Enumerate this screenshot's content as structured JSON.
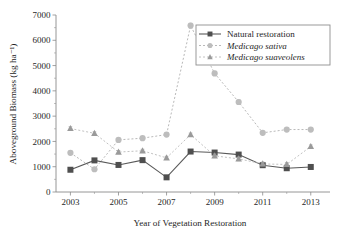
{
  "chart_data": {
    "type": "line",
    "title": "",
    "xlabel": "Year of Vegetation Restoration",
    "ylabel": "Aboveground Biomass (kg ha⁻¹)",
    "x": [
      2003,
      2004,
      2005,
      2006,
      2007,
      2008,
      2009,
      2010,
      2011,
      2012,
      2013
    ],
    "xlim": [
      2002.4,
      2013.8
    ],
    "ylim": [
      0,
      7000
    ],
    "xticks": [
      2003,
      2005,
      2007,
      2009,
      2011,
      2013
    ],
    "xticklabels": [
      "2003",
      "2005",
      "2007",
      "2009",
      "2011",
      "2013"
    ],
    "xminorticks": [
      2004,
      2006,
      2008,
      2010,
      2012
    ],
    "yticks": [
      0,
      1000,
      2000,
      3000,
      4000,
      5000,
      6000,
      7000
    ],
    "yticklabels": [
      "0",
      "1000",
      "2000",
      "3000",
      "4000",
      "5000",
      "6000",
      "7000"
    ],
    "grid": false,
    "legend_position": "upper right",
    "series": [
      {
        "name": "Natural restoration",
        "marker": "square",
        "linestyle": "solid",
        "color": "#4f4f4f",
        "italic": false,
        "values": [
          880,
          1250,
          1070,
          1260,
          580,
          1600,
          1560,
          1480,
          1060,
          940,
          990
        ],
        "errors": [
          60,
          70,
          60,
          70,
          50,
          60,
          60,
          60,
          60,
          60,
          50
        ]
      },
      {
        "name": "Medicago sativa",
        "marker": "circle",
        "linestyle": "dotted",
        "color": "#bdbdbd",
        "italic": true,
        "values": [
          1550,
          900,
          2060,
          2130,
          2270,
          6580,
          4690,
          3560,
          2340,
          2470,
          2470
        ],
        "errors": [
          70,
          60,
          60,
          60,
          60,
          90,
          80,
          80,
          60,
          60,
          60
        ]
      },
      {
        "name": "Medicago suaveolens",
        "marker": "triangle",
        "linestyle": "dotted",
        "color": "#9a9a9a",
        "italic": true,
        "values": [
          2510,
          2320,
          1580,
          1630,
          1350,
          2270,
          1430,
          1310,
          1110,
          1090,
          1800
        ],
        "errors": [
          70,
          60,
          60,
          60,
          60,
          60,
          70,
          70,
          70,
          70,
          60
        ]
      }
    ]
  },
  "legend": {
    "entries": [
      {
        "label": "Natural restoration",
        "marker": "square"
      },
      {
        "label": "Medicago sativa",
        "marker": "circle"
      },
      {
        "label": "Medicago suaveolens",
        "marker": "triangle"
      }
    ]
  },
  "colors": {
    "axis": "#8a8a8a",
    "text": "#1f1f1f",
    "natural_restoration": "#4f4f4f",
    "medicago_sativa": "#bdbdbd",
    "medicago_suaveolens": "#9a9a9a",
    "background": "#ffffff"
  }
}
